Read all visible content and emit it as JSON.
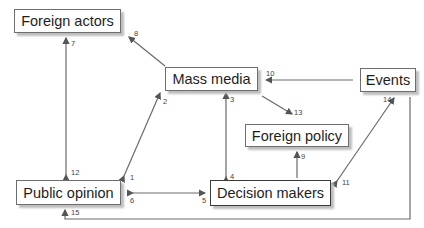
{
  "nodes": {
    "foreign_actors": "Foreign actors",
    "mass_media": "Mass media",
    "events": "Events",
    "foreign_policy": "Foreign policy",
    "public_opinion": "Public opinion",
    "decision_makers": "Decision makers"
  },
  "edge_labels": {
    "e1": "1",
    "e2": "2",
    "e3": "3",
    "e4": "4",
    "e5": "5",
    "e6": "6",
    "e7": "7",
    "e8": "8",
    "e9": "9",
    "e10": "10",
    "e11": "11",
    "e12": "12",
    "e13": "13",
    "e14": "14",
    "e15": "15"
  },
  "edges": [
    {
      "from": "Mass media",
      "to": "Public opinion",
      "labels": [
        "2",
        "1"
      ],
      "bidirectional": true
    },
    {
      "from": "Mass media",
      "to": "Decision makers",
      "labels": [
        "3",
        "4"
      ],
      "bidirectional": true
    },
    {
      "from": "Public opinion",
      "to": "Decision makers",
      "labels": [
        "6",
        "5"
      ],
      "bidirectional": true
    },
    {
      "from": "Foreign actors",
      "to": "Public opinion",
      "labels": [
        "7",
        "12"
      ],
      "bidirectional": true
    },
    {
      "from": "Mass media",
      "to": "Foreign actors",
      "labels": [
        "8"
      ],
      "bidirectional": false
    },
    {
      "from": "Decision makers",
      "to": "Foreign policy",
      "labels": [
        "9"
      ],
      "bidirectional": false
    },
    {
      "from": "Events",
      "to": "Mass media",
      "labels": [
        "10"
      ],
      "bidirectional": false
    },
    {
      "from": "Events",
      "to": "Decision makers",
      "labels": [
        "14",
        "11"
      ],
      "bidirectional": true
    },
    {
      "from": "Mass media",
      "to": "Foreign policy",
      "labels": [
        "13"
      ],
      "bidirectional": false
    },
    {
      "from": "Events",
      "to": "Public opinion",
      "labels": [
        "15"
      ],
      "bidirectional": false
    }
  ],
  "colors": {
    "line": "#6a6a6a",
    "border": "#6e6e6e",
    "text": "#1e1e1e"
  }
}
